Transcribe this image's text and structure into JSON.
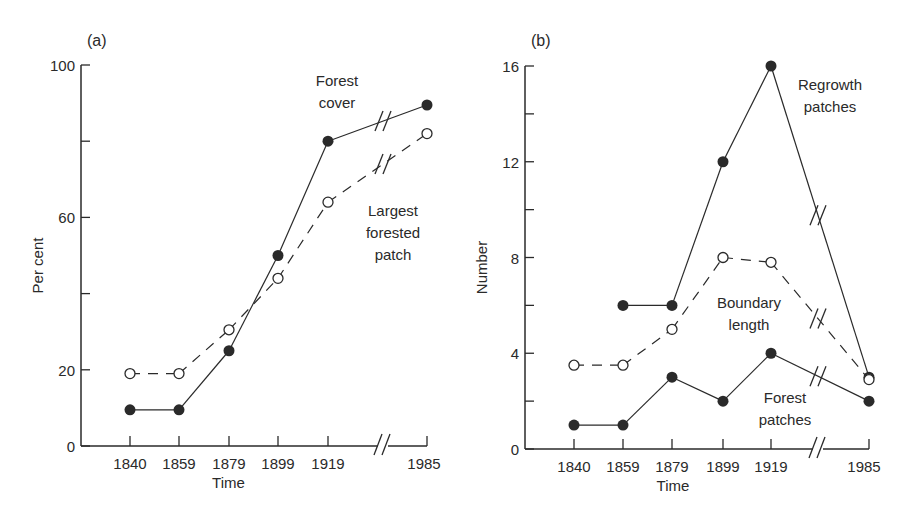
{
  "chart_data": [
    {
      "panel": "(a)",
      "type": "line",
      "xlabel": "Time",
      "ylabel": "Per cent",
      "ylim": [
        0,
        100
      ],
      "yticks_labeled": [
        0,
        20,
        60,
        100
      ],
      "yticks_minor": [
        40,
        80
      ],
      "categories": [
        "1840",
        "1859",
        "1879",
        "1899",
        "1919",
        "1985"
      ],
      "axis_break_between": [
        "1919",
        "1985"
      ],
      "series": [
        {
          "name": "Forest cover",
          "style": "solid",
          "marker": "filled-circle",
          "values": [
            9.5,
            9.5,
            25,
            50,
            80,
            89.5
          ]
        },
        {
          "name": "Largest forested patch",
          "style": "dashed",
          "marker": "open-circle",
          "values": [
            19,
            19,
            30.5,
            44,
            64,
            82
          ]
        }
      ],
      "annotations": [
        {
          "text_lines": [
            "Forest",
            "cover"
          ]
        },
        {
          "text_lines": [
            "Largest",
            "forested",
            "patch"
          ]
        }
      ]
    },
    {
      "panel": "(b)",
      "type": "line",
      "xlabel": "Time",
      "ylabel": "Number",
      "ylim": [
        0,
        16
      ],
      "yticks_labeled": [
        0,
        4,
        8,
        12,
        16
      ],
      "yticks_minor": [
        2,
        6,
        10,
        14
      ],
      "categories": [
        "1840",
        "1859",
        "1879",
        "1899",
        "1919",
        "1985"
      ],
      "axis_break_between": [
        "1919",
        "1985"
      ],
      "series": [
        {
          "name": "Regrowth patches",
          "style": "solid",
          "marker": "filled-circle",
          "values": [
            null,
            6,
            6,
            12,
            16,
            3
          ]
        },
        {
          "name": "Boundary length",
          "style": "dashed",
          "marker": "open-circle",
          "values": [
            3.5,
            3.5,
            5,
            8,
            7.8,
            2.9
          ]
        },
        {
          "name": "Forest patches",
          "style": "solid",
          "marker": "filled-circle",
          "values": [
            1,
            1,
            3,
            2,
            4,
            2
          ]
        }
      ],
      "annotations": [
        {
          "text_lines": [
            "Regrowth",
            "patches"
          ]
        },
        {
          "text_lines": [
            "Boundary",
            "length"
          ]
        },
        {
          "text_lines": [
            "Forest",
            "patches"
          ]
        }
      ]
    }
  ],
  "layout": {
    "a": {
      "x0": 81,
      "y0": 446,
      "ytop": 65,
      "ymax": 100,
      "xs": [
        130,
        179,
        229,
        278,
        328,
        427
      ],
      "break_x": 383,
      "ox": -3
    },
    "b": {
      "x0": 525,
      "y0": 449,
      "ytop": 66,
      "ymax": 16,
      "xs": [
        574,
        623,
        672,
        723,
        771,
        869
      ],
      "break_x": 818,
      "ox": -5
    },
    "annot_pos": {
      "a": [
        [
          337,
          86
        ],
        [
          393,
          216
        ]
      ],
      "b": [
        [
          830,
          90
        ],
        [
          749,
          308
        ],
        [
          785,
          403
        ]
      ]
    }
  },
  "colors": {
    "ink": "#2a2a2a",
    "background": "#ffffff"
  }
}
